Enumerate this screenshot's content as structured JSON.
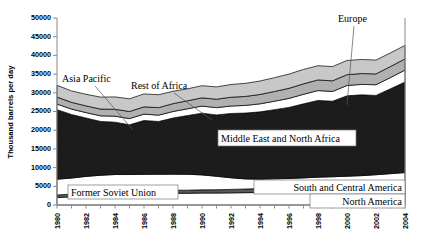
{
  "chart_data": {
    "type": "area",
    "title": "",
    "subtitle": "",
    "xlabel": "",
    "ylabel": "Thousand barrels per day",
    "stacked": true,
    "grid": false,
    "legend_position": "inline-annotations",
    "xlim": [
      1980,
      2004
    ],
    "ylim": [
      0,
      50000
    ],
    "x": [
      1980,
      1981,
      1982,
      1983,
      1984,
      1985,
      1986,
      1987,
      1988,
      1989,
      1990,
      1991,
      1992,
      1993,
      1994,
      1995,
      1996,
      1997,
      1998,
      1999,
      2000,
      2001,
      2002,
      2003,
      2004
    ],
    "xticks": [
      1980,
      1982,
      1984,
      1986,
      1988,
      1990,
      1992,
      1994,
      1996,
      1998,
      2000,
      2002,
      2004
    ],
    "xticklabels": [
      "1980",
      "1982",
      "1984",
      "1986",
      "1988",
      "1990",
      "1992",
      "1994",
      "1996",
      "1998",
      "2000",
      "2002",
      "2004"
    ],
    "yticks": [
      0,
      5000,
      10000,
      15000,
      20000,
      25000,
      30000,
      35000,
      40000,
      45000,
      50000
    ],
    "yticklabels": [
      "0",
      "5000",
      "10000",
      "15000",
      "20000",
      "25000",
      "30000",
      "35000",
      "40000",
      "45000",
      "50000"
    ],
    "series": [
      {
        "name": "North America",
        "color": "#ffffff",
        "values": [
          2000,
          2200,
          2600,
          2900,
          3050,
          3150,
          3150,
          3150,
          3150,
          3150,
          3200,
          3200,
          3250,
          3300,
          3350,
          3400,
          3450,
          3500,
          3600,
          3650,
          3700,
          3750,
          3850,
          3950,
          4050
        ]
      },
      {
        "name": "South and Central America",
        "color": "#595959",
        "values": [
          700,
          700,
          700,
          700,
          750,
          750,
          750,
          780,
          800,
          820,
          850,
          880,
          920,
          980,
          1050,
          1150,
          1250,
          1350,
          1450,
          1500,
          1550,
          1600,
          1650,
          1680,
          1720
        ]
      },
      {
        "name": "Former Soviet Union",
        "color": "#ffffff",
        "values": [
          4200,
          4300,
          4350,
          4350,
          4350,
          4250,
          4300,
          4300,
          4300,
          4250,
          4000,
          3600,
          3100,
          2700,
          2500,
          2450,
          2400,
          2400,
          2400,
          2400,
          2450,
          2500,
          2600,
          2750,
          2900
        ]
      },
      {
        "name": "Middle East and North Africa",
        "color": "#1c1c1c",
        "values": [
          18600,
          17000,
          15600,
          14400,
          14000,
          13300,
          14400,
          14100,
          15000,
          15700,
          16500,
          16400,
          17200,
          17600,
          18000,
          18500,
          19000,
          19800,
          20500,
          20200,
          21500,
          21600,
          21200,
          22700,
          24200
        ]
      },
      {
        "name": "Rest of Africa",
        "color": "#ffffff",
        "values": [
          1500,
          1450,
          1450,
          1500,
          1600,
          1650,
          1700,
          1700,
          1750,
          1800,
          1900,
          1950,
          2000,
          2050,
          2150,
          2250,
          2400,
          2550,
          2650,
          2600,
          2750,
          2800,
          2850,
          3000,
          3200
        ]
      },
      {
        "name": "Asia Pacific",
        "color": "#b0b0b0",
        "values": [
          1850,
          1800,
          1800,
          1800,
          1850,
          1900,
          1950,
          2000,
          2100,
          2150,
          2200,
          2250,
          2350,
          2400,
          2500,
          2600,
          2700,
          2800,
          2850,
          2850,
          2900,
          2900,
          2900,
          2950,
          3000
        ]
      },
      {
        "name": "Europe",
        "color": "#c8c8c8",
        "values": [
          3150,
          3050,
          3100,
          3200,
          3300,
          3400,
          3450,
          3450,
          3300,
          3200,
          3250,
          3300,
          3400,
          3500,
          3600,
          3700,
          3800,
          3850,
          3800,
          3800,
          3800,
          3750,
          3700,
          3650,
          3600
        ]
      }
    ],
    "annotations": [
      {
        "label": "Asia Pacific",
        "boxed": false
      },
      {
        "label": "Rest of Africa",
        "boxed": false
      },
      {
        "label": "Europe",
        "boxed": false
      },
      {
        "label": "Middle East and North Africa",
        "boxed": true
      },
      {
        "label": "Former Soviet Union",
        "boxed": true
      },
      {
        "label": "South and Central America",
        "boxed": true
      },
      {
        "label": "North America",
        "boxed": true
      }
    ]
  }
}
